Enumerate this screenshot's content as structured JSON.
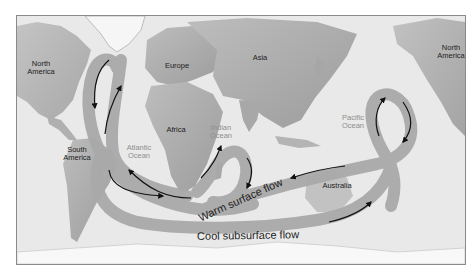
{
  "figure": {
    "colors": {
      "ocean": "#e9e9e9",
      "land_light": "#c4c4c4",
      "land_dark": "#8f8f8f",
      "ice": "#f8f8f8",
      "flow_band": "#a8a8a8",
      "arrow": "#111111",
      "frame": "#8a8a8a"
    }
  },
  "continents": {
    "north_america_west": "North\nAmerica",
    "north_america_east": "North\nAmerica",
    "south_america": "South\nAmerica",
    "europe": "Europe",
    "asia": "Asia",
    "africa": "Africa",
    "australia": "Australia"
  },
  "oceans": {
    "atlantic": "Atlantic\nOcean",
    "indian": "Indian\nOcean",
    "pacific": "Pacific\nOcean"
  },
  "flows": {
    "warm": "Warm surface flow",
    "cool": "Cool subsurface flow"
  }
}
